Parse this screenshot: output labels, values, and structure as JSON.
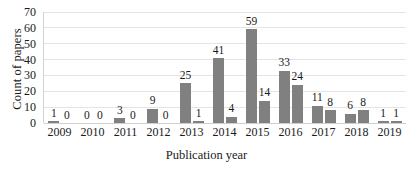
{
  "chart_data": {
    "type": "bar",
    "title": "",
    "xlabel": "Publication year",
    "ylabel": "Count of papers",
    "ylim": [
      0,
      70
    ],
    "yticks": [
      0,
      10,
      20,
      30,
      40,
      50,
      60,
      70
    ],
    "grid": "horizontal",
    "legend": "none",
    "bar_color": "#808080",
    "categories": [
      "2009",
      "2010",
      "2011",
      "2012",
      "2013",
      "2014",
      "2015",
      "2016",
      "2017",
      "2018",
      "2019"
    ],
    "series": [
      {
        "name": "series-1",
        "values": [
          1,
          0,
          3,
          9,
          25,
          41,
          59,
          33,
          11,
          6,
          1
        ],
        "labels": [
          "1",
          "0",
          "3",
          "9",
          "25",
          "41",
          "59",
          "33",
          "11",
          "6",
          "1"
        ]
      },
      {
        "name": "series-2",
        "values": [
          0,
          0,
          0,
          0,
          1,
          4,
          14,
          24,
          8,
          8,
          1
        ],
        "labels": [
          "0",
          "0",
          "0",
          "0",
          "1",
          "4",
          "14",
          "24",
          "8",
          "8",
          "1"
        ]
      }
    ]
  }
}
